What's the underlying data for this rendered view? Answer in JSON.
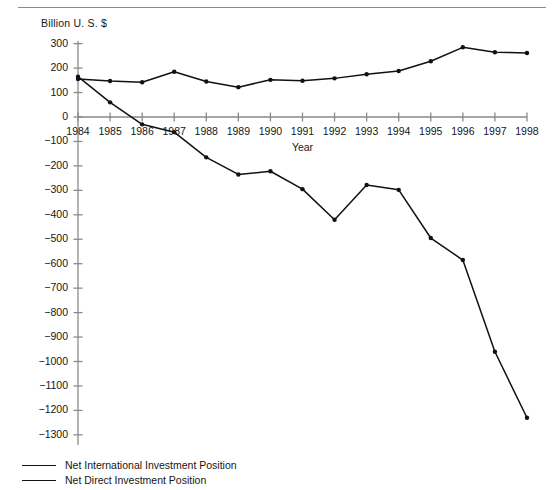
{
  "chart_data": {
    "type": "line",
    "title": "",
    "subtitle": "",
    "xlabel": "Year",
    "ylabel": "Billion U. S. $",
    "categories": [
      "1984",
      "1985",
      "1986",
      "1987",
      "1988",
      "1989",
      "1990",
      "1991",
      "1992",
      "1993",
      "1994",
      "1995",
      "1996",
      "1997",
      "1998"
    ],
    "x": [
      1984,
      1985,
      1986,
      1987,
      1988,
      1989,
      1990,
      1991,
      1992,
      1993,
      1994,
      1995,
      1996,
      1997,
      1998
    ],
    "xlim": [
      1984,
      1998
    ],
    "ylim": [
      -1300,
      300
    ],
    "ytick_values": [
      300,
      200,
      100,
      0,
      -100,
      -200,
      -300,
      -400,
      -500,
      -600,
      -700,
      -800,
      -900,
      -1000,
      -1100,
      -1200,
      -1300
    ],
    "ytick_labels": [
      "300",
      "200",
      "100",
      "0",
      "−100",
      "−200",
      "−300",
      "−400",
      "−500",
      "−600",
      "−700",
      "−800",
      "−900",
      "−1000",
      "−1100",
      "−1200",
      "−1300"
    ],
    "grid": false,
    "legend_position": "bottom-left",
    "marker": "filled-circle",
    "line_color": "#111111",
    "series": [
      {
        "name": "Net International Investment Position",
        "values": [
          165,
          60,
          -30,
          -62,
          -165,
          -235,
          -222,
          -295,
          -420,
          -278,
          -298,
          -495,
          -585,
          -960,
          -1230
        ]
      },
      {
        "name": "Net Direct Investment Position",
        "values": [
          155,
          147,
          142,
          185,
          145,
          122,
          152,
          148,
          158,
          175,
          188,
          228,
          285,
          265,
          262
        ]
      }
    ]
  },
  "legend": {
    "items": [
      {
        "label": "Net International Investment Position"
      },
      {
        "label": "Net Direct Investment Position"
      }
    ]
  },
  "colors": {
    "line": "#111111",
    "axis": "#8a8a8a",
    "text": "#161616"
  }
}
